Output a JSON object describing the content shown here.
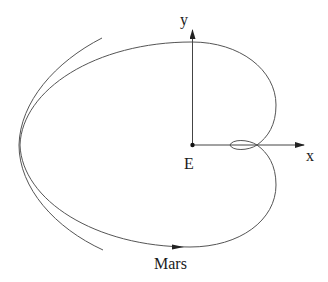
{
  "diagram": {
    "type": "orbital-path",
    "labels": {
      "y_axis": "y",
      "x_axis": "x",
      "origin": "E",
      "planet": "Mars"
    },
    "colors": {
      "curve": "#555555",
      "axis": "#444444",
      "text": "#1a1a1a",
      "background": "#ffffff"
    },
    "elements": [
      {
        "name": "main-path",
        "kind": "closed curve with small retrograde loop near x-axis"
      },
      {
        "name": "outer-arc",
        "kind": "partial arc enclosing left side"
      },
      {
        "name": "x-axis",
        "kind": "arrow from E to the right"
      },
      {
        "name": "y-axis",
        "kind": "arrow from E upward"
      },
      {
        "name": "direction-arrow",
        "kind": "arrowhead on bottom of path pointing right"
      }
    ]
  }
}
